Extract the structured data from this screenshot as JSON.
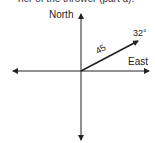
{
  "caption": "ner of the thrower (part a).",
  "diagram": {
    "axes": {
      "north_label": "North",
      "east_label": "East"
    },
    "vector": {
      "magnitude_label": "45",
      "angle_label": "32°",
      "angle_deg": 32
    },
    "colors": {
      "line": "#222222",
      "background": "#ffffff"
    }
  }
}
